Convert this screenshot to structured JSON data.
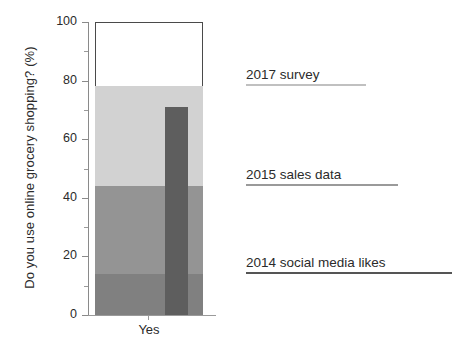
{
  "chart_data": {
    "type": "bar",
    "title": "",
    "subtitle": "",
    "xlabel": "",
    "ylabel": "Do you use online grocery shopping? (%)",
    "categories": [
      "Yes"
    ],
    "ylim": [
      0,
      100
    ],
    "xlim_note": "single category",
    "grid": false,
    "legend_position": "right-inline-annotations",
    "y_ticks": [
      {
        "value": 0,
        "label": "0",
        "major": true
      },
      {
        "value": 10,
        "label": "",
        "major": false
      },
      {
        "value": 20,
        "label": "20",
        "major": true
      },
      {
        "value": 30,
        "label": "",
        "major": false
      },
      {
        "value": 40,
        "label": "40",
        "major": true
      },
      {
        "value": 50,
        "label": "",
        "major": false
      },
      {
        "value": 60,
        "label": "60",
        "major": true
      },
      {
        "value": 70,
        "label": "",
        "major": false
      },
      {
        "value": 80,
        "label": "80",
        "major": true
      },
      {
        "value": 90,
        "label": "",
        "major": false
      },
      {
        "value": 100,
        "label": "100",
        "major": true
      }
    ],
    "stack_segments": [
      {
        "name": "2014 social media likes",
        "from": 0,
        "to": 14,
        "value": 14,
        "color": "#808080"
      },
      {
        "name": "2015 sales data",
        "from": 14,
        "to": 44,
        "value": 30,
        "color": "#949494"
      },
      {
        "name": "2017 survey",
        "from": 44,
        "to": 78,
        "value": 34,
        "color": "#d2d2d2"
      },
      {
        "name": "remainder",
        "from": 78,
        "to": 100,
        "value": 22,
        "color": "#ffffff"
      }
    ],
    "overlay_bar": {
      "name": "overlay-response-bar",
      "from": 0,
      "to": 71,
      "value": 71,
      "color": "#5e5e5e"
    },
    "annotations": [
      {
        "label": "2017 survey",
        "value": 78,
        "rule_color": "#c0c0c0",
        "rule_width_px": 120
      },
      {
        "label": "2015 sales data",
        "value": 44,
        "rule_color": "#9a9a9a",
        "rule_width_px": 152
      },
      {
        "label": "2014 social media likes",
        "value": 14,
        "rule_color": "#555555",
        "rule_width_px": 206
      }
    ]
  },
  "axis": {
    "y_axis_line_color": "#8a8a8a",
    "x_axis_line_color": "#9a9a9a",
    "x_category_label": "Yes"
  }
}
